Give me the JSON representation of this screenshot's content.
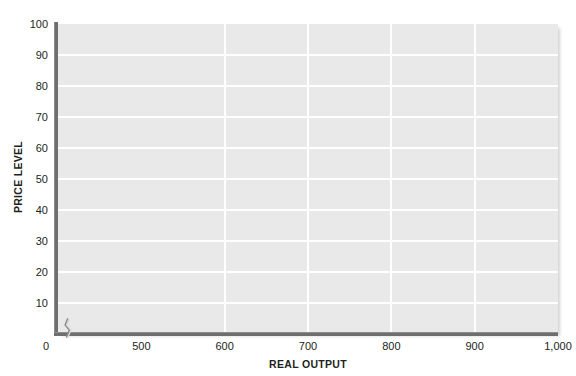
{
  "chart_data": {
    "type": "line",
    "title": "",
    "subtitle": "",
    "xlabel": "REAL OUTPUT",
    "ylabel": "PRICE LEVEL",
    "xlim": [
      400,
      1000
    ],
    "ylim": [
      0,
      100
    ],
    "grid": true,
    "legend": null,
    "series": [],
    "annotations": [
      {
        "name": "x-axis-break",
        "symbol": "zigzag",
        "meaning": "axis scale break between 0 and 500"
      }
    ],
    "x_ticks": [
      {
        "label": "0",
        "value": 0
      },
      {
        "label": "500",
        "value": 500
      },
      {
        "label": "600",
        "value": 600
      },
      {
        "label": "700",
        "value": 700
      },
      {
        "label": "800",
        "value": 800
      },
      {
        "label": "900",
        "value": 900
      },
      {
        "label": "1,000",
        "value": 1000
      }
    ],
    "y_ticks": [
      {
        "label": "100",
        "value": 100
      },
      {
        "label": "90",
        "value": 90
      },
      {
        "label": "80",
        "value": 80
      },
      {
        "label": "70",
        "value": 70
      },
      {
        "label": "60",
        "value": 60
      },
      {
        "label": "50",
        "value": 50
      },
      {
        "label": "40",
        "value": 40
      },
      {
        "label": "30",
        "value": 30
      },
      {
        "label": "20",
        "value": 20
      },
      {
        "label": "10",
        "value": 10
      }
    ],
    "gridlines": {
      "horizontal_values": [
        10,
        20,
        30,
        40,
        50,
        60,
        70,
        80,
        90
      ],
      "vertical_values": [
        600,
        700,
        800,
        900
      ]
    },
    "colors": {
      "plot_background": "#e9e9e9",
      "gridline": "#ffffff",
      "axis_line": "#6e6e6e",
      "text": "#231f20",
      "page_background": "#ffffff"
    }
  }
}
